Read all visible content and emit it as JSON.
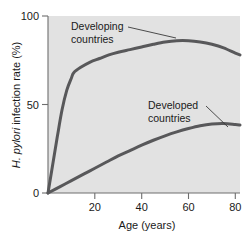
{
  "chart_data": {
    "type": "line",
    "title": "",
    "xlabel": "Age (years)",
    "ylabel": "H. pylori infection rate (%)",
    "ylabel_italic_part": "H. pylori",
    "ylabel_rest": " infection rate (%)",
    "xlim": [
      0,
      82
    ],
    "ylim": [
      0,
      100
    ],
    "xticks": [
      20,
      40,
      60,
      80
    ],
    "xtick_labels": [
      "20",
      "40",
      "60",
      "80"
    ],
    "yticks": [
      0,
      50,
      100
    ],
    "ytick_labels": [
      "0",
      "50",
      "100"
    ],
    "grid": false,
    "legend": "annotations-inline",
    "background": "#e2e2e2",
    "line_color": "#58585a",
    "series": [
      {
        "name": "Developing countries",
        "label": "Developing",
        "label_line2": "countries",
        "x": [
          0,
          2,
          4,
          6,
          8,
          10,
          11,
          14,
          18,
          22,
          26,
          30,
          35,
          40,
          45,
          50,
          55,
          60,
          65,
          70,
          75,
          80,
          82
        ],
        "values": [
          0,
          16,
          32,
          47,
          58,
          65,
          68,
          71,
          74,
          76,
          78,
          79.5,
          81,
          82.5,
          84,
          85.3,
          86,
          86,
          85.3,
          84,
          82,
          79,
          78
        ]
      },
      {
        "name": "Developed countries",
        "label": "Developed",
        "label_line2": "countries",
        "x": [
          0,
          5,
          10,
          15,
          20,
          25,
          30,
          35,
          40,
          45,
          50,
          55,
          60,
          65,
          70,
          75,
          80,
          82
        ],
        "values": [
          0,
          3.5,
          7,
          10.5,
          14,
          17.5,
          21,
          24,
          27,
          29.8,
          32.3,
          34.5,
          36.4,
          38,
          39,
          39.3,
          38.7,
          38.4
        ]
      }
    ],
    "annotations": [
      {
        "name": "developing-countries-annotation",
        "text_line1": "Developing",
        "text_line2": "countries",
        "leader_from": [
          128,
          27
        ],
        "leader_to": [
          176,
          38
        ]
      },
      {
        "name": "developed-countries-annotation",
        "text_line1": "Developed",
        "text_line2": "countries",
        "leader_from": [
          206,
          106
        ],
        "leader_to": [
          228,
          127
        ]
      }
    ]
  }
}
